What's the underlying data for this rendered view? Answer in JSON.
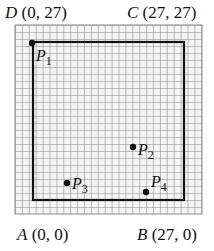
{
  "corners": {
    "D": {
      "letter": "D",
      "coords": "(0, 27)"
    },
    "C": {
      "letter": "C",
      "coords": "(27, 27)"
    },
    "A": {
      "letter": "A",
      "coords": "(0, 0)"
    },
    "B": {
      "letter": "B",
      "coords": "(27, 0)"
    }
  },
  "points": [
    {
      "name": "P",
      "sub": "1"
    },
    {
      "name": "P",
      "sub": "2"
    },
    {
      "name": "P",
      "sub": "3"
    },
    {
      "name": "P",
      "sub": "4"
    }
  ],
  "grid": {
    "size": 27,
    "line_color": "#8a8a8a",
    "border_color": "#111111"
  }
}
